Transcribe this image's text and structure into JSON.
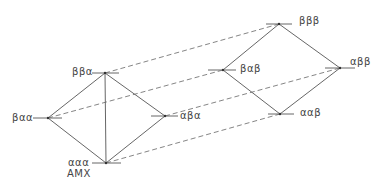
{
  "diagram": {
    "type": "energy-level-diagram",
    "colors": {
      "line": "#555555",
      "dashed": "#666666",
      "text": "#444444"
    },
    "left_diamond": {
      "top": {
        "label": "ββα"
      },
      "left": {
        "label": "βαα"
      },
      "right": {
        "label": "αβα"
      },
      "bottom": {
        "label": "ααα",
        "sublabel": "AMX"
      }
    },
    "right_diamond": {
      "top": {
        "label": "βββ"
      },
      "left": {
        "label": "βαβ"
      },
      "right": {
        "label": "αββ"
      },
      "bottom": {
        "label": "ααβ"
      }
    },
    "connections": [
      {
        "from": "ββα",
        "to": "βββ",
        "style": "dashed"
      },
      {
        "from": "βαα",
        "to": "βαβ",
        "style": "dashed"
      },
      {
        "from": "αβα",
        "to": "αββ",
        "style": "dashed"
      },
      {
        "from": "ααα",
        "to": "ααβ",
        "style": "dashed"
      }
    ]
  }
}
